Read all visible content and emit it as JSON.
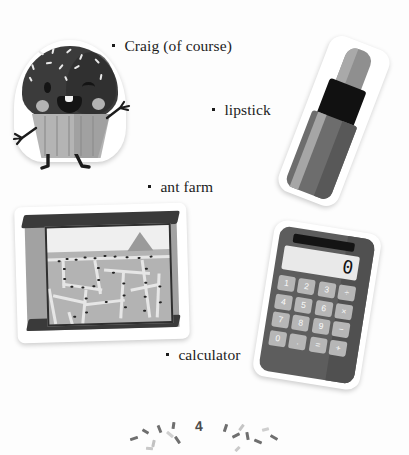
{
  "page": {
    "background_color": "#fdfdfd",
    "page_number": "4",
    "kind": "illustrated-list-page"
  },
  "list": {
    "items": [
      {
        "label": "Craig (of course)",
        "bullet": "square-bullet",
        "illustration": "cupcake-character-sticker"
      },
      {
        "label": "lipstick",
        "bullet": "square-bullet",
        "illustration": "lipstick-sticker"
      },
      {
        "label": "ant farm",
        "bullet": "square-bullet",
        "illustration": "ant-farm-sticker"
      },
      {
        "label": "calculator",
        "bullet": "square-bullet",
        "illustration": "calculator-sticker"
      }
    ]
  },
  "cupcake": {
    "name": "Craig",
    "description": "winking cupcake character with sprinkles, blush cheeks, arms and legs",
    "frosting_color": "#3b3b3b",
    "liner_color": "#b4b4b4",
    "sprinkle_color": "#e8e8e8"
  },
  "lipstick": {
    "description": "tilted lipstick tube with bullet tip",
    "tip_color": "#8f8f8f",
    "band_color": "#111111",
    "body_color": "#6d6d6d"
  },
  "ant_farm": {
    "description": "glass ant farm tank with sand tunnels and ants",
    "frame_color": "#3a3a3a",
    "sand_color": "#b3b3b3",
    "tunnel_color": "#e6e6e6",
    "ant_color": "#242424"
  },
  "calculator": {
    "display_value": "0",
    "body_color": "#5d5d5d",
    "key_color": "#b6b6b6",
    "screen_color": "#e9e9e9",
    "solar_panel": "solar-strip",
    "keys": [
      "1",
      "2",
      "3",
      "÷",
      "4",
      "5",
      "6",
      "×",
      "7",
      "8",
      "9",
      "−",
      "0",
      ".",
      "=",
      "+"
    ]
  },
  "colors": {
    "text": "#1c1c1c",
    "sticker_border": "#ffffff"
  }
}
